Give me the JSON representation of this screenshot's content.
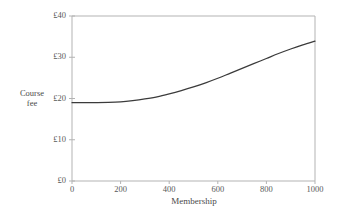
{
  "chart_data": {
    "type": "line",
    "title": "",
    "subtitle": "",
    "xlabel": "Membership",
    "ylabel": "Course fee",
    "ylabel_line1": "Course",
    "ylabel_line2": "fee",
    "xlim": [
      0,
      1000
    ],
    "ylim": [
      0,
      40
    ],
    "grid": false,
    "legend": null,
    "x_ticks": [
      0,
      200,
      400,
      600,
      800,
      1000
    ],
    "x_tick_labels": [
      "0",
      "200",
      "400",
      "600",
      "800",
      "1000"
    ],
    "y_ticks": [
      0,
      10,
      20,
      30,
      40
    ],
    "y_tick_labels": [
      "£0",
      "£10",
      "£20",
      "£30",
      "£40"
    ],
    "currency_symbol": "£",
    "series": [
      {
        "name": "Course fee",
        "color": "#3b3b3b",
        "x": [
          0,
          50,
          100,
          150,
          200,
          250,
          300,
          350,
          400,
          450,
          500,
          550,
          600,
          650,
          700,
          750,
          800,
          850,
          900,
          950,
          1000
        ],
        "y": [
          19.0,
          19.0,
          19.0,
          19.05,
          19.2,
          19.5,
          19.9,
          20.4,
          21.1,
          21.9,
          22.8,
          23.8,
          24.9,
          26.1,
          27.3,
          28.5,
          29.7,
          30.9,
          32.0,
          33.0,
          33.9
        ]
      }
    ],
    "annotations": []
  },
  "colors": {
    "background": "#ffffff",
    "axis": "#b3b3b3",
    "curve": "#3b3b3b",
    "tick_text": "#595959",
    "label_text": "#4a4a4a"
  },
  "geometry": {
    "plot_left": 72,
    "plot_right": 315,
    "plot_top": 16,
    "plot_bottom": 181
  }
}
